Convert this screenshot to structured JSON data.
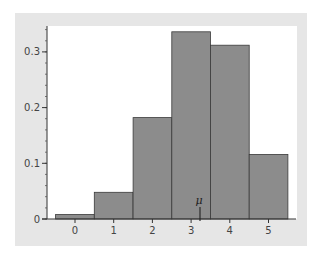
{
  "chart_data": {
    "type": "bar",
    "title": "",
    "xlabel": "",
    "ylabel": "",
    "categories": [
      "0",
      "1",
      "2",
      "3",
      "4",
      "5"
    ],
    "values": [
      0.008,
      0.048,
      0.182,
      0.336,
      0.312,
      0.116
    ],
    "ylim": [
      0,
      0.34
    ],
    "yticks": [
      "0",
      "0.1",
      "0.2",
      "0.3"
    ],
    "y_minor_tick_step": 0.02,
    "grid": false,
    "bar_color": "#8c8c8c",
    "bar_edge_color": "#3a3a3a",
    "annotations": [
      {
        "label": "μ",
        "x": 3.23,
        "type": "marker-line"
      }
    ]
  }
}
